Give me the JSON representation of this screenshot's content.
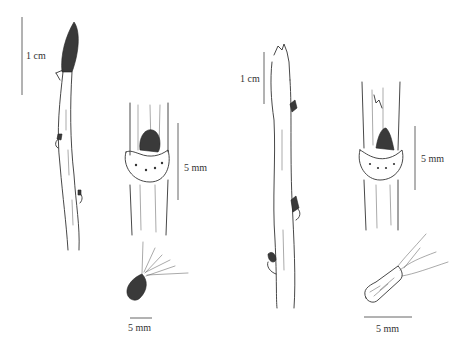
{
  "figure": {
    "panels": [
      {
        "id": "twig-a",
        "description": "twig with elongated terminal bud",
        "scale_label": "1 cm"
      },
      {
        "id": "leaf-scar-a",
        "description": "leaf scar with bud and bundle scars",
        "scale_label": "5 mm"
      },
      {
        "id": "seed-a",
        "description": "winged/hairy seed",
        "scale_label": "5 mm"
      },
      {
        "id": "twig-b",
        "description": "twig with short terminal bud",
        "scale_label": "1 cm"
      },
      {
        "id": "leaf-scar-b",
        "description": "leaf scar with conical bud",
        "scale_label": "5 mm"
      },
      {
        "id": "seed-b",
        "description": "elongated seed with tufts",
        "scale_label": "5 mm"
      }
    ]
  }
}
